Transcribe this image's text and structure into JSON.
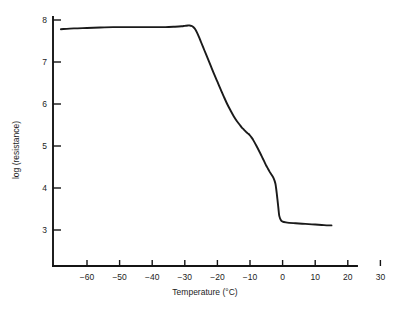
{
  "chart_data": {
    "type": "line",
    "title": "",
    "xlabel": "Temperature (°C)",
    "ylabel": "log (resistance)",
    "xlim": [
      -68,
      31
    ],
    "ylim": [
      2.55,
      8.25
    ],
    "grid": false,
    "legend": "none",
    "x_ticks": [
      -60,
      -50,
      -40,
      -30,
      -20,
      -10,
      0,
      10,
      20,
      30
    ],
    "x_tick_labels": [
      "−60",
      "−50",
      "−40",
      "−30",
      "−20",
      "−10",
      "0",
      "10",
      "20",
      "30"
    ],
    "y_ticks": [
      3,
      4,
      5,
      6,
      7,
      8
    ],
    "y_tick_labels": [
      "3",
      "4",
      "5",
      "6",
      "7",
      "8"
    ],
    "series": [
      {
        "name": "resistance",
        "x": [
          -68,
          -64,
          -60,
          -56,
          -52,
          -48,
          -44,
          -40,
          -36,
          -33,
          -31,
          -30,
          -29,
          -28.5,
          -28,
          -27.5,
          -27,
          -26.5,
          -26,
          -25.5,
          -25,
          -24,
          -23,
          -22,
          -21,
          -20,
          -19,
          -18,
          -17,
          -16,
          -15,
          -14,
          -13,
          -12.5,
          -12,
          -11.5,
          -11,
          -10.5,
          -10,
          -9.5,
          -9,
          -8,
          -7,
          -6.5,
          -6,
          -5.5,
          -5,
          -4.5,
          -4,
          -3.5,
          -3,
          -2.5,
          -2.2,
          -2,
          -1.8,
          -1.6,
          -1.4,
          -1.2,
          -1,
          -0.5,
          0,
          1,
          2,
          4,
          6,
          8,
          10,
          12,
          14,
          15
        ],
        "y": [
          7.78,
          7.8,
          7.81,
          7.82,
          7.83,
          7.83,
          7.83,
          7.83,
          7.83,
          7.84,
          7.85,
          7.86,
          7.87,
          7.87,
          7.86,
          7.84,
          7.8,
          7.74,
          7.66,
          7.57,
          7.47,
          7.28,
          7.09,
          6.9,
          6.71,
          6.53,
          6.35,
          6.17,
          6.0,
          5.85,
          5.71,
          5.59,
          5.49,
          5.44,
          5.4,
          5.36,
          5.32,
          5.29,
          5.25,
          5.2,
          5.14,
          5.0,
          4.85,
          4.77,
          4.69,
          4.61,
          4.53,
          4.46,
          4.39,
          4.33,
          4.27,
          4.18,
          4.1,
          4.0,
          3.88,
          3.74,
          3.6,
          3.45,
          3.33,
          3.23,
          3.2,
          3.18,
          3.17,
          3.16,
          3.15,
          3.14,
          3.13,
          3.12,
          3.11,
          3.11
        ]
      }
    ]
  }
}
